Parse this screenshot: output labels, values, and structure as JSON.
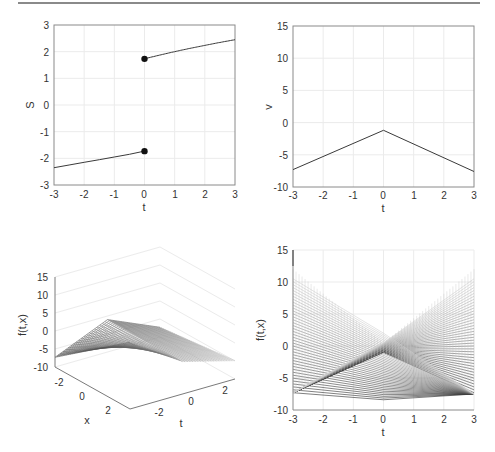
{
  "chart_data": [
    {
      "id": "top_left",
      "type": "line",
      "title": "",
      "xlabel": "t",
      "ylabel": "S",
      "xlim": [
        -3,
        3
      ],
      "ylim": [
        -3,
        3
      ],
      "xticks": [
        "-3",
        "-2",
        "-1",
        "0",
        "1",
        "2",
        "3"
      ],
      "yticks": [
        "3",
        "2",
        "1",
        "0",
        "-1",
        "-2",
        "-3"
      ],
      "grid": true,
      "series": [
        {
          "name": "upper branch",
          "x": [
            0,
            0.5,
            1,
            1.5,
            2,
            2.5,
            3
          ],
          "y": [
            1.73,
            1.87,
            2.0,
            2.12,
            2.24,
            2.35,
            2.45
          ]
        },
        {
          "name": "lower branch",
          "x": [
            -3,
            -2.5,
            -2,
            -1.5,
            -1,
            -0.5,
            0
          ],
          "y": [
            -2.35,
            -2.25,
            -2.15,
            -2.05,
            -1.95,
            -1.85,
            -1.73
          ]
        }
      ],
      "markers": [
        {
          "x": 0,
          "y": 1.73,
          "style": "filled-circle"
        },
        {
          "x": 0,
          "y": -1.73,
          "style": "filled-circle"
        }
      ]
    },
    {
      "id": "top_right",
      "type": "line",
      "title": "",
      "xlabel": "t",
      "ylabel": "v",
      "xlim": [
        -3,
        3
      ],
      "ylim": [
        -10,
        15
      ],
      "xticks": [
        "-3",
        "-2",
        "-1",
        "0",
        "1",
        "2",
        "3"
      ],
      "yticks": [
        "15",
        "10",
        "5",
        "0",
        "-5",
        "-10"
      ],
      "grid": true,
      "series": [
        {
          "name": "v",
          "x": [
            -3,
            0,
            3
          ],
          "y": [
            -7.3,
            -1.2,
            -7.6
          ]
        }
      ]
    },
    {
      "id": "bottom_left",
      "type": "surface3d",
      "title": "",
      "xlabel": "x",
      "ylabel": "t",
      "zlabel": "f(t,x)",
      "zlim": [
        -10,
        15
      ],
      "zticks": [
        "15",
        "10",
        "5",
        "0",
        "-5",
        "-10"
      ],
      "xticks": [
        "-2",
        "0",
        "2"
      ],
      "yticks": [
        "-2",
        "0",
        "2"
      ],
      "grid": true,
      "description": "Mesh surface over t,x in [-3,3]; peak ~12 at one corner, minimum ~-9 at opposite edges"
    },
    {
      "id": "bottom_right",
      "type": "line",
      "title": "",
      "xlabel": "t",
      "ylabel": "f(t,x)",
      "xlim": [
        -3,
        3
      ],
      "ylim": [
        -10,
        15
      ],
      "xticks": [
        "-3",
        "-2",
        "-1",
        "0",
        "1",
        "2",
        "3"
      ],
      "yticks": [
        "15",
        "10",
        "5",
        "0",
        "-5",
        "-10"
      ],
      "grid": true,
      "description": "Side view of mesh lines; family of straight lines crossing near (0,-1), spanning from ~-7.3 to ~10.5 at t=±3"
    }
  ],
  "plots": {
    "tl": {
      "xlabel": "t",
      "ylabel": "S",
      "xticks": [
        "-3",
        "-2",
        "-1",
        "0",
        "1",
        "2",
        "3"
      ],
      "yticks": [
        "3",
        "2",
        "1",
        "0",
        "-1",
        "-2",
        "-3"
      ]
    },
    "tr": {
      "xlabel": "t",
      "ylabel": "v",
      "xticks": [
        "-3",
        "-2",
        "-1",
        "0",
        "1",
        "2",
        "3"
      ],
      "yticks": [
        "15",
        "10",
        "5",
        "0",
        "-5",
        "-10"
      ]
    },
    "bl": {
      "zlabel": "f(t,x)",
      "xlabel": "x",
      "tlabel": "t",
      "zticks": [
        "15",
        "10",
        "5",
        "0",
        "-5",
        "-10"
      ],
      "xticks": [
        "-2",
        "0",
        "2"
      ],
      "tticks": [
        "-2",
        "0",
        "2"
      ]
    },
    "br": {
      "xlabel": "t",
      "ylabel": "f(t,x)",
      "xticks": [
        "-3",
        "-2",
        "-1",
        "0",
        "1",
        "2",
        "3"
      ],
      "yticks": [
        "15",
        "10",
        "5",
        "0",
        "-5",
        "-10"
      ]
    }
  },
  "colors": {
    "axis": "#7a7a7a",
    "grid": "#ebebeb",
    "line": "#3a3a3a",
    "marker": "#111111",
    "rule": "#8a8a8a"
  }
}
